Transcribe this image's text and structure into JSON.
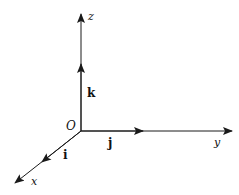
{
  "diagram": {
    "type": "3d-coordinate-axes",
    "origin": {
      "label": "O"
    },
    "axes": [
      {
        "name": "x",
        "label": "x",
        "unit_vector": "i"
      },
      {
        "name": "y",
        "label": "y",
        "unit_vector": "j"
      },
      {
        "name": "z",
        "label": "z",
        "unit_vector": "k"
      }
    ],
    "colors": {
      "stroke": "#1a1a1a",
      "background": "#ffffff"
    }
  }
}
